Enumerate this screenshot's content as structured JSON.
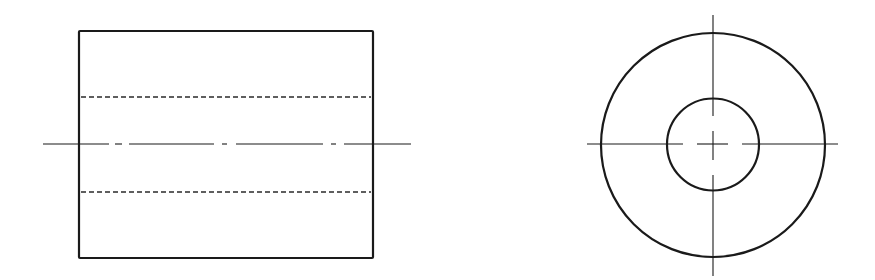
{
  "drawing": {
    "type": "orthographic-projection",
    "subject": "hollow cylinder (tube / bushing)",
    "colors": {
      "background": "#ffffff",
      "line": "#1a1a1a"
    },
    "views": [
      {
        "name": "front-view",
        "shape": "rectangle",
        "outline": {
          "x1": 79,
          "y1": 31,
          "x2": 373,
          "y2": 258
        },
        "hidden_lines": [
          {
            "y": 97,
            "x1": 81,
            "x2": 371
          },
          {
            "y": 192,
            "x1": 81,
            "x2": 371
          }
        ],
        "center_line": {
          "y": 144,
          "segments": [
            [
              43,
              109
            ],
            [
              115,
              122
            ],
            [
              129,
              214
            ],
            [
              222,
              227
            ],
            [
              236,
              323
            ],
            [
              331,
              336
            ],
            [
              344,
              411
            ]
          ]
        }
      },
      {
        "name": "side-view",
        "shape": "concentric-circles",
        "center": {
          "x": 713,
          "y": 145
        },
        "outer_circle_radius": 112,
        "inner_circle_radius": 46,
        "horizontal_center_line": {
          "y": 144,
          "segments": [
            [
              587,
              683
            ],
            [
              697,
              728
            ],
            [
              742,
              838
            ]
          ]
        },
        "vertical_center_line": {
          "x": 713,
          "segments": [
            [
              15,
              116
            ],
            [
              131,
              160
            ],
            [
              175,
              276
            ]
          ]
        }
      }
    ]
  }
}
